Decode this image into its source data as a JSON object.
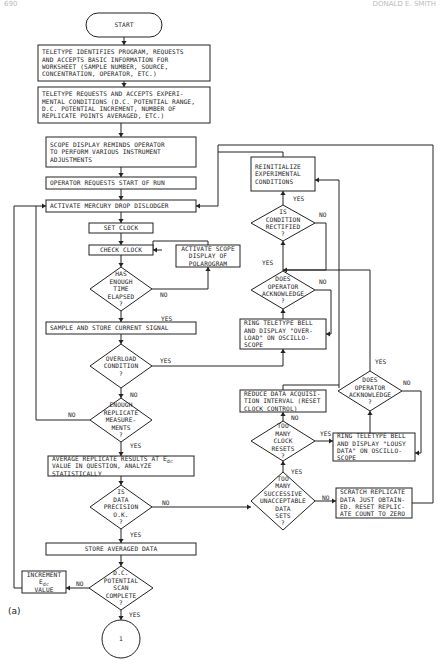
{
  "header": {
    "page_number": "690",
    "running_title": "DONALD E. SMITH"
  },
  "caption": "(a)",
  "nodes": {
    "start": {
      "lines": [
        "START"
      ]
    },
    "teletype_identifies": {
      "lines": [
        "TELETYPE IDENTIFIES PROGRAM, REQUESTS",
        "AND ACCEPTS BASIC INFORMATION FOR",
        "WORKSHEET (SAMPLE NUMBER, SOURCE,",
        "CONCENTRATION, OPERATOR, ETC.)"
      ]
    },
    "teletype_requests": {
      "lines": [
        "TELETYPE REQUESTS AND ACCEPTS EXPERI-",
        "MENTAL CONDITIONS (D.C. POTENTIAL RANGE,",
        "D.C. POTENTIAL INCREMENT, NUMBER OF",
        "REPLICATE POINTS AVERAGED, ETC.)"
      ]
    },
    "scope_display": {
      "lines": [
        "SCOPE DISPLAY REMINDS OPERATOR",
        "TO PERFORM VARIOUS INSTRUMENT",
        "ADJUSTMENTS"
      ]
    },
    "operator_requests": {
      "lines": [
        "OPERATOR REQUESTS START OF RUN"
      ]
    },
    "activate_dislodger": {
      "lines": [
        "ACTIVATE MERCURY DROP DISLODGER"
      ]
    },
    "set_clock": {
      "lines": [
        "SET CLOCK"
      ]
    },
    "check_clock": {
      "lines": [
        "CHECK CLOCK"
      ]
    },
    "activate_scope": {
      "lines": [
        "ACTIVATE SCOPE",
        "DISPLAY OF",
        "POLAROGRAM"
      ]
    },
    "enough_time": {
      "lines": [
        "HAS",
        "ENOUGH",
        "TIME",
        "ELAPSED",
        "?"
      ]
    },
    "sample_store": {
      "lines": [
        "SAMPLE AND STORE CURRENT SIGNAL"
      ]
    },
    "overload": {
      "lines": [
        "OVERLOAD",
        "CONDITION",
        "?"
      ]
    },
    "enough_replicate": {
      "lines": [
        "ENOUGH",
        "REPLICATE",
        "MEASURE-",
        "MENTS",
        "?"
      ]
    },
    "average_replicate": {
      "lines": [
        "AVERAGE REPLICATE RESULTS AT E",
        "VALUE IN QUESTION, ANALYZE",
        "STATISTICALLY"
      ],
      "subscript": "dc"
    },
    "data_precision": {
      "lines": [
        "IS",
        "DATA",
        "PRECISION",
        "O.K.",
        "?"
      ]
    },
    "store_averaged": {
      "lines": [
        "STORE AVERAGED DATA"
      ]
    },
    "scan_complete": {
      "lines": [
        "D.C.",
        "POTENTIAL",
        "SCAN",
        "COMPLETE",
        "?"
      ]
    },
    "increment": {
      "lines": [
        "INCREMENT",
        "E",
        "VALUE"
      ],
      "subscript": "dc"
    },
    "connector": {
      "lines": [
        "1"
      ]
    },
    "reinitialize": {
      "lines": [
        "REINITIALIZE",
        "EXPERIMENTAL",
        "CONDITIONS"
      ]
    },
    "condition_rectified": {
      "lines": [
        "IS",
        "CONDITION",
        "RECTIFIED",
        "?"
      ]
    },
    "operator_ack_1": {
      "lines": [
        "DOES",
        "OPERATOR",
        "ACKNOWLEDGE",
        "?"
      ]
    },
    "ring_overload": {
      "lines": [
        "RING TELETYPE BELL",
        "AND DISPLAY \"OVER-",
        "LOAD\" ON OSCILLO-",
        "SCOPE"
      ]
    },
    "reduce_interval": {
      "lines": [
        "REDUCE DATA ACQUISI-",
        "TION INTERVAL (RESET",
        "CLOCK CONTROL)"
      ]
    },
    "too_many_resets": {
      "lines": [
        "TOO",
        "MANY",
        "CLOCK",
        "RESETS",
        "?"
      ]
    },
    "too_many_unacceptable": {
      "lines": [
        "TOO",
        "MANY",
        "SUCCESSIVE",
        "UNACCEPTABLE",
        "DATA",
        "SETS",
        "?"
      ]
    },
    "ring_lousy": {
      "lines": [
        "RING TELETYPE BELL",
        "AND DISPLAY \"LOUSY",
        "DATA\" ON OSCILLO-",
        "SCOPE"
      ]
    },
    "operator_ack_2": {
      "lines": [
        "DOES",
        "OPERATOR",
        "ACKNOWLEDGE",
        "?"
      ]
    },
    "scratch": {
      "lines": [
        "SCRATCH REPLICATE",
        "DATA JUST OBTAIN-",
        "ED. RESET REPLIC-",
        "ATE COUNT TO ZERO"
      ]
    }
  },
  "edge_labels": {
    "yes": "YES",
    "no": "NO"
  }
}
